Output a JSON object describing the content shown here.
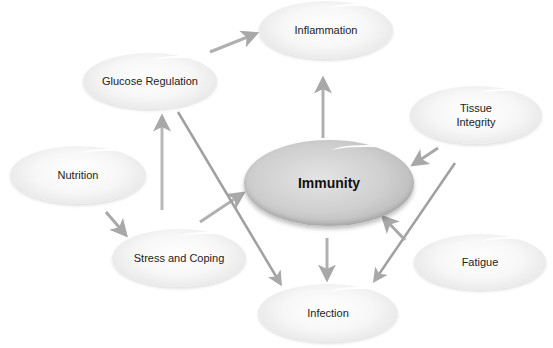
{
  "diagram": {
    "center": {
      "id": "immunity",
      "label": "Immunity"
    },
    "nodes": [
      {
        "id": "inflammation",
        "label": "Inflammation"
      },
      {
        "id": "glucose",
        "label": "Glucose Regulation"
      },
      {
        "id": "tissue",
        "label_line1": "Tissue",
        "label_line2": "Integrity"
      },
      {
        "id": "nutrition",
        "label": "Nutrition"
      },
      {
        "id": "stress",
        "label": "Stress and Coping"
      },
      {
        "id": "fatigue",
        "label": "Fatigue"
      },
      {
        "id": "infection",
        "label": "Infection"
      }
    ],
    "edges": [
      {
        "from": "Glucose Regulation",
        "to": "Inflammation"
      },
      {
        "from": "Immunity",
        "to": "Inflammation"
      },
      {
        "from": "Stress and Coping",
        "to": "Glucose Regulation"
      },
      {
        "from": "Nutrition",
        "to": "Stress and Coping"
      },
      {
        "from": "Stress and Coping",
        "to": "Immunity"
      },
      {
        "from": "Glucose Regulation",
        "to": "Infection"
      },
      {
        "from": "Immunity",
        "to": "Infection"
      },
      {
        "from": "Tissue Integrity",
        "to": "Immunity"
      },
      {
        "from": "Tissue Integrity",
        "to": "Infection"
      },
      {
        "from": "Fatigue",
        "to": "Immunity"
      }
    ],
    "colors": {
      "arrow": "#a8a8a8",
      "node_fill": "#f2f2f2",
      "center_fill": "#c4c4c4",
      "text": "#222222"
    }
  }
}
